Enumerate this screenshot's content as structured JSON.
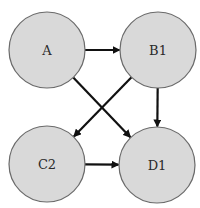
{
  "diagram": {
    "type": "directed-graph",
    "nodes": [
      {
        "id": "A",
        "label": "A",
        "cx": 47,
        "cy": 50,
        "r": 38
      },
      {
        "id": "B1",
        "label": "B1",
        "cx": 158,
        "cy": 50,
        "r": 38
      },
      {
        "id": "C2",
        "label": "C2",
        "cx": 47,
        "cy": 164,
        "r": 38
      },
      {
        "id": "D1",
        "label": "D1",
        "cx": 157,
        "cy": 165,
        "r": 38
      }
    ],
    "edges": [
      {
        "from": "A",
        "to": "B1"
      },
      {
        "from": "A",
        "to": "D1"
      },
      {
        "from": "B1",
        "to": "C2"
      },
      {
        "from": "B1",
        "to": "D1"
      },
      {
        "from": "C2",
        "to": "D1"
      }
    ],
    "colors": {
      "node_fill": "#d9d9d9",
      "node_stroke": "#6a6a6a",
      "edge": "#111111",
      "label": "#2a2a2a",
      "background": "#ffffff"
    }
  }
}
